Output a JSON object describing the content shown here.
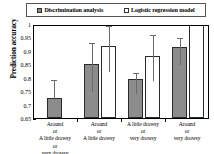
{
  "chart_data": {
    "type": "bar",
    "title": "",
    "xlabel": "",
    "ylabel": "Prediction accuracy",
    "ylim": [
      0.65,
      1.0
    ],
    "ytick_labels": [
      "1",
      "0.95",
      "0.9",
      "0.85",
      "0.8",
      "0.75",
      "0.7",
      "0.65"
    ],
    "ytick_values": [
      1.0,
      0.95,
      0.9,
      0.85,
      0.8,
      0.75,
      0.7,
      0.65
    ],
    "grid": false,
    "legend_position": "top",
    "categories": [
      "Around or A little drowsy or very drowsy",
      "Around or A little drowsy",
      "A little drowsy or very drowsy",
      "Around or very drowsy"
    ],
    "category_lines": [
      [
        "Around",
        "or",
        "A little drowsy",
        "or",
        "very drowsy"
      ],
      [
        "Around",
        "or",
        "A little drowsy"
      ],
      [
        "A little drowsy",
        "or",
        "very drowsy"
      ],
      [
        "Around",
        "or",
        "very drowsy"
      ]
    ],
    "series": [
      {
        "name": "Discrimination analysis",
        "color": "#8c8c8c",
        "values": [
          0.725,
          0.85,
          0.795,
          0.913
        ],
        "err_upper": [
          0.8,
          0.935,
          0.825,
          0.955
        ],
        "err_lower": [
          0.725,
          0.755,
          0.745,
          0.855
        ]
      },
      {
        "name": "Logistic regression model",
        "color": "#ffffff",
        "values": [
          null,
          0.918,
          0.88,
          1.0
        ],
        "err_upper": [
          null,
          1.0,
          0.965,
          null
        ],
        "err_lower": [
          null,
          0.828,
          0.795,
          null
        ]
      }
    ]
  },
  "legend": {
    "entries": [
      {
        "label": "Discrimination analysis",
        "swatch": "filled-square-icon"
      },
      {
        "label": "Logistic regression model",
        "swatch": "open-square-icon"
      }
    ]
  },
  "axis": {
    "y_title": "Prediction accuracy"
  }
}
